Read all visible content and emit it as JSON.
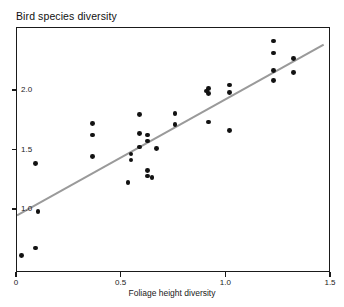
{
  "chart_data": {
    "type": "scatter",
    "title": "Bird species diversity",
    "xlabel": "Foliage height diversity",
    "ylabel": "Bird species diversity",
    "xlim": [
      0,
      1.5
    ],
    "ylim": [
      0.55,
      2.42
    ],
    "xticks": [
      0,
      0.5,
      1.0,
      1.5
    ],
    "xtick_labels": [
      "0",
      "0.5",
      "1.0",
      "1.5"
    ],
    "yticks": [
      1.0,
      1.5,
      2.0
    ],
    "ytick_labels": [
      "1.0",
      "1.5",
      "2.0"
    ],
    "grid": false,
    "legend": null,
    "marker_color": "#121212",
    "marker_size": 4.2,
    "points": [
      {
        "x": 0.02,
        "y": 0.62
      },
      {
        "x": 0.09,
        "y": 0.68
      },
      {
        "x": 0.1,
        "y": 0.99
      },
      {
        "x": 0.09,
        "y": 1.39
      },
      {
        "x": 0.36,
        "y": 1.45
      },
      {
        "x": 0.36,
        "y": 1.63
      },
      {
        "x": 0.36,
        "y": 1.73
      },
      {
        "x": 0.53,
        "y": 1.23
      },
      {
        "x": 0.545,
        "y": 1.42
      },
      {
        "x": 0.545,
        "y": 1.47
      },
      {
        "x": 0.585,
        "y": 1.8
      },
      {
        "x": 0.585,
        "y": 1.64
      },
      {
        "x": 0.585,
        "y": 1.53
      },
      {
        "x": 0.625,
        "y": 1.58
      },
      {
        "x": 0.625,
        "y": 1.63
      },
      {
        "x": 0.625,
        "y": 1.33
      },
      {
        "x": 0.625,
        "y": 1.285
      },
      {
        "x": 0.645,
        "y": 1.275
      },
      {
        "x": 0.665,
        "y": 1.52
      },
      {
        "x": 0.755,
        "y": 1.81
      },
      {
        "x": 0.755,
        "y": 1.72
      },
      {
        "x": 0.905,
        "y": 2.0
      },
      {
        "x": 0.915,
        "y": 1.98
      },
      {
        "x": 0.915,
        "y": 2.02
      },
      {
        "x": 0.915,
        "y": 1.74
      },
      {
        "x": 1.015,
        "y": 2.05
      },
      {
        "x": 1.015,
        "y": 1.99
      },
      {
        "x": 1.015,
        "y": 1.67
      },
      {
        "x": 1.225,
        "y": 2.42
      },
      {
        "x": 1.225,
        "y": 2.32
      },
      {
        "x": 1.225,
        "y": 2.17
      },
      {
        "x": 1.225,
        "y": 2.085
      },
      {
        "x": 1.32,
        "y": 2.27
      },
      {
        "x": 1.32,
        "y": 2.155
      }
    ],
    "trendline": {
      "type": "line",
      "color": "#9a9a9a",
      "x_start": 0.0,
      "y_start": 0.955,
      "x_end": 1.465,
      "y_end": 2.39
    }
  }
}
